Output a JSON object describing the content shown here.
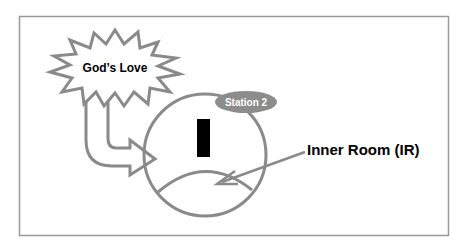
{
  "diagram": {
    "burst_label": "God’s Love",
    "station_label": "Station 2",
    "station_numeral": "I",
    "inner_room_label": "Inner Room (IR)"
  },
  "colors": {
    "outline": "#8a8a8a",
    "frame": "#9a9a9a",
    "station_fill": "#8c8c8c",
    "station_text": "#ffffff",
    "bar": "#000000",
    "text": "#000000"
  }
}
